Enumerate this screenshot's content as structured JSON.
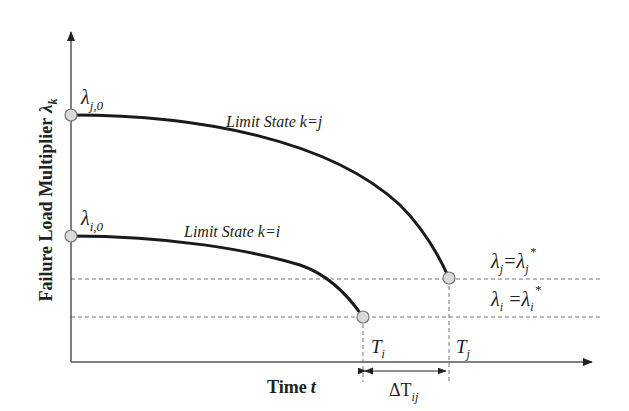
{
  "diagram": {
    "y_axis_label": "Failure Load Multiplier",
    "y_axis_symbol": "λ",
    "y_axis_symbol_sub": "k",
    "x_axis_label": "Time",
    "x_axis_symbol": "t",
    "curves": [
      {
        "name": "Limit State k=j",
        "label_prefix": "Limit State ",
        "label_eq": "k=j",
        "start_label": "λ",
        "start_sub": "j,0",
        "end_time_label": "T",
        "end_time_sub": "j",
        "threshold_label_left": "λ",
        "threshold_label_left_sub": "j",
        "threshold_label_right": "=λ",
        "threshold_label_right_sub": "j",
        "threshold_sup": "*"
      },
      {
        "name": "Limit State k=i",
        "label_prefix": "Limit State ",
        "label_eq": "k=i",
        "start_label": "λ",
        "start_sub": "i,0",
        "end_time_label": "T",
        "end_time_sub": "i",
        "threshold_label_left": "λ",
        "threshold_label_left_sub": "i",
        "threshold_label_right": " =λ",
        "threshold_label_right_sub": "i",
        "threshold_sup": "*"
      }
    ],
    "interval": {
      "label": "ΔT",
      "sub": "ij"
    },
    "colors": {
      "curve": "#1a1a1a",
      "axis": "#555555",
      "dashed": "#777777",
      "marker_fill": "#d9d9d9",
      "marker_stroke": "#777777"
    }
  }
}
